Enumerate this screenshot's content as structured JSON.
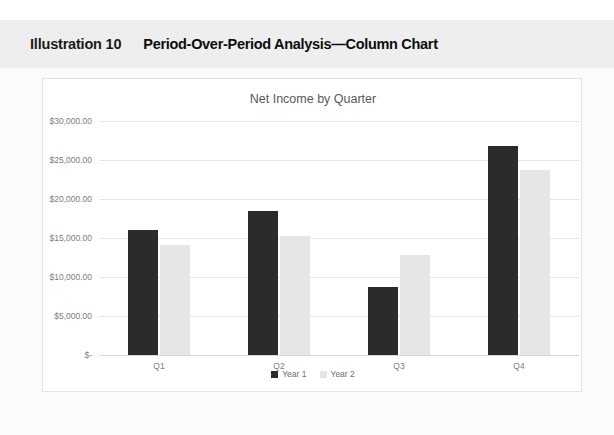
{
  "header": {
    "illustration_label": "Illustration 10",
    "illustration_title": "Period-Over-Period Analysis—Column Chart",
    "band_color": "#eeeeee"
  },
  "colors": {
    "series_1": "#2b2b2b",
    "series_2": "#e6e6e6",
    "gridline": "#e6e6e6",
    "tick_text": "#7d7d7d",
    "title_text": "#595959",
    "card_background": "#ffffff",
    "page_background": "#fbfbfb"
  },
  "chart_data": {
    "type": "bar",
    "title": "Net Income by Quarter",
    "xlabel": "",
    "ylabel": "",
    "categories": [
      "Q1",
      "Q2",
      "Q3",
      "Q4"
    ],
    "series": [
      {
        "name": "Year 1",
        "color": "#2b2b2b",
        "values": [
          16000,
          18400,
          8700,
          26800
        ]
      },
      {
        "name": "Year 2",
        "color": "#e6e6e6",
        "values": [
          14100,
          15300,
          12800,
          23700
        ]
      }
    ],
    "ylim": [
      0,
      30000
    ],
    "ytick_values": [
      30000,
      25000,
      20000,
      15000,
      10000,
      5000,
      0
    ],
    "ytick_labels": [
      "$30,000.00",
      "$25,000.00",
      "$20,000.00",
      "$15,000.00",
      "$10,000.00",
      "$5,000.00",
      "$-"
    ],
    "grid": true,
    "legend_position": "bottom"
  }
}
